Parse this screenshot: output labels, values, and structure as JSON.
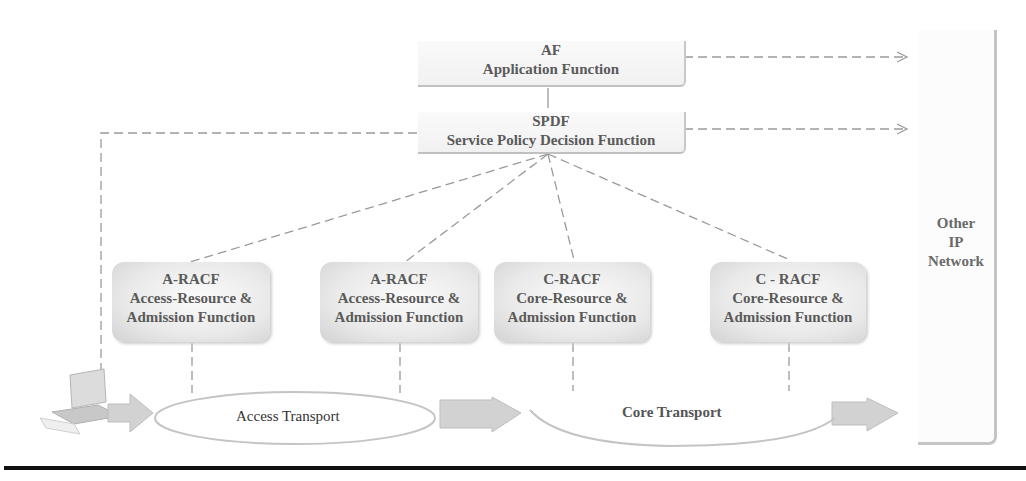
{
  "diagram": {
    "type": "network-architecture",
    "nodes": {
      "af": {
        "abbr": "AF",
        "name": "Application Function"
      },
      "spdf": {
        "abbr": "SPDF",
        "name": "Service Policy Decision Function"
      },
      "racf": [
        {
          "abbr": "A-RACF",
          "line1": "Access-Resource &",
          "line2": "Admission Function"
        },
        {
          "abbr": "A-RACF",
          "line1": "Access-Resource &",
          "line2": "Admission Function"
        },
        {
          "abbr": "C-RACF",
          "line1": "Core-Resource &",
          "line2": "Admission Function"
        },
        {
          "abbr": "C - RACF",
          "line1": "Core-Resource &",
          "line2": "Admission Function"
        }
      ],
      "other_network": {
        "line1": "Other",
        "line2": "IP",
        "line3": "Network"
      },
      "access_transport": "Access Transport",
      "core_transport": "Core Transport",
      "terminal": "laptop"
    },
    "colors": {
      "line": "#9a9a9a",
      "box_fill": "#eeeeee",
      "text": "#5a5a5a",
      "rule": "#111111"
    }
  }
}
